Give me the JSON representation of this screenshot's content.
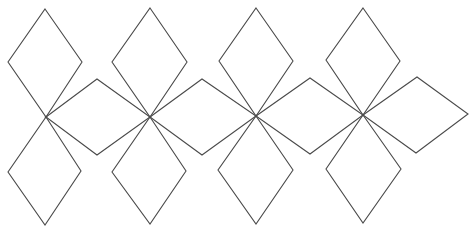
{
  "diagram": {
    "stroke_color": "#4a4a4a",
    "background": "#ffffff",
    "groups": [
      {
        "center": [
          46,
          117
        ],
        "rhombi": [
          {
            "name": "top",
            "points": [
              [
                45,
                9
              ],
              [
                82,
                62
              ],
              [
                46,
                117
              ],
              [
                8,
                62
              ]
            ]
          },
          {
            "name": "bottom",
            "points": [
              [
                46,
                117
              ],
              [
                81,
                171
              ],
              [
                45,
                225
              ],
              [
                8,
                172
              ]
            ]
          },
          {
            "name": "right",
            "points": [
              [
                46,
                117
              ],
              [
                97,
                79
              ],
              [
                150,
                117
              ],
              [
                97,
                155
              ]
            ]
          }
        ]
      },
      {
        "center": [
          150,
          117
        ],
        "rhombi": [
          {
            "name": "top",
            "points": [
              [
                150,
                8
              ],
              [
                187,
                62
              ],
              [
                150,
                117
              ],
              [
                112,
                62
              ]
            ]
          },
          {
            "name": "bottom",
            "points": [
              [
                150,
                117
              ],
              [
                186,
                171
              ],
              [
                150,
                224
              ],
              [
                112,
                172
              ]
            ]
          },
          {
            "name": "right",
            "points": [
              [
                150,
                117
              ],
              [
                202,
                79
              ],
              [
                256,
                116
              ],
              [
                202,
                155
              ]
            ]
          }
        ]
      },
      {
        "center": [
          256,
          116
        ],
        "rhombi": [
          {
            "name": "top",
            "points": [
              [
                256,
                8
              ],
              [
                293,
                61
              ],
              [
                256,
                116
              ],
              [
                219,
                61
              ]
            ]
          },
          {
            "name": "bottom",
            "points": [
              [
                256,
                116
              ],
              [
                293,
                170
              ],
              [
                256,
                224
              ],
              [
                218,
                170
              ]
            ]
          },
          {
            "name": "right",
            "points": [
              [
                256,
                116
              ],
              [
                310,
                78
              ],
              [
                363,
                115
              ],
              [
                310,
                154
              ]
            ]
          }
        ]
      },
      {
        "center": [
          363,
          115
        ],
        "rhombi": [
          {
            "name": "top",
            "points": [
              [
                363,
                8
              ],
              [
                400,
                61
              ],
              [
                363,
                115
              ],
              [
                326,
                60
              ]
            ]
          },
          {
            "name": "bottom",
            "points": [
              [
                363,
                115
              ],
              [
                401,
                169
              ],
              [
                363,
                223
              ],
              [
                326,
                169
              ]
            ]
          },
          {
            "name": "right",
            "points": [
              [
                363,
                115
              ],
              [
                417,
                77
              ],
              [
                468,
                114
              ],
              [
                416,
                153
              ]
            ]
          }
        ]
      }
    ]
  }
}
